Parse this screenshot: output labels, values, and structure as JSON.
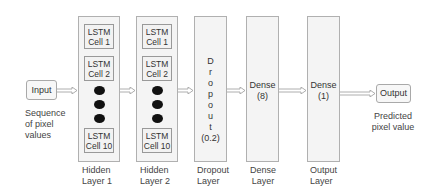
{
  "diagram": {
    "input": {
      "label": "Input",
      "caption": [
        "Sequence",
        "of pixel",
        "values"
      ]
    },
    "hidden_layer_1": {
      "cells": [
        {
          "line1": "LSTM",
          "line2": "Cell 1"
        },
        {
          "line1": "LSTM",
          "line2": "Cell 2"
        },
        {
          "line1": "LSTM",
          "line2": "Cell 10"
        }
      ],
      "caption": [
        "Hidden",
        "Layer 1"
      ]
    },
    "hidden_layer_2": {
      "cells": [
        {
          "line1": "LSTM",
          "line2": "Cell 1"
        },
        {
          "line1": "LSTM",
          "line2": "Cell 2"
        },
        {
          "line1": "LSTM",
          "line2": "Cell 10"
        }
      ],
      "caption": [
        "Hidden",
        "Layer 2"
      ]
    },
    "dropout_layer": {
      "letters": [
        "D",
        "r",
        "o",
        "p",
        "o",
        "u",
        "t"
      ],
      "rate": "(0.2)",
      "caption": [
        "Dropout",
        "Layer"
      ]
    },
    "dense_layer": {
      "name": "Dense",
      "units": "(8)",
      "caption": [
        "Dense",
        "Layer"
      ]
    },
    "output_layer": {
      "name": "Dense",
      "units": "(1)",
      "caption": [
        "Output",
        "Layer"
      ]
    },
    "output": {
      "label": "Output",
      "caption": [
        "Predicted",
        "pixel value"
      ]
    },
    "colors": {
      "border": "#a9a9a9",
      "fill": "#f4f4f4",
      "dot": "#111111",
      "text": "#333333"
    }
  }
}
